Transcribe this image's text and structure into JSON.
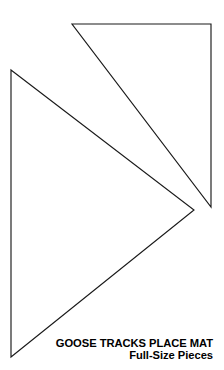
{
  "page": {
    "width": 224,
    "height": 370,
    "background_color": "#ffffff",
    "line_color": "#1a1a1a"
  },
  "caption": {
    "title": "GOOSE TRACKS PLACE MAT",
    "subtitle": "Full-Size Pieces"
  },
  "diagram": {
    "pieces": [
      {
        "name": "upper-right-triangle",
        "points": "72,24 211,24 211,207",
        "vertices": [
          [
            72,
            24
          ],
          [
            211,
            24
          ],
          [
            211,
            207
          ]
        ]
      },
      {
        "name": "left-large-triangle",
        "points": "11,70 194,210 11,357",
        "vertices": [
          [
            11,
            70
          ],
          [
            194,
            210
          ],
          [
            11,
            357
          ]
        ]
      }
    ]
  }
}
